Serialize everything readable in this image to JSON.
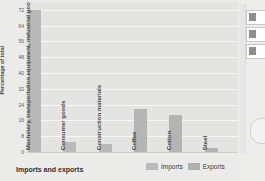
{
  "chart_data": {
    "type": "bar",
    "title": "",
    "xlabel": "Imports and exports",
    "ylabel": "Percentage of total",
    "ylim": [
      0,
      76
    ],
    "grid": true,
    "legend_position": "bottom-right",
    "categories": [
      "Machinery, transportation equipment, industrial goods",
      "Consumer goods",
      "Construction materials",
      "Coffee",
      "Cotton",
      "Steel"
    ],
    "series": [
      {
        "name": "Imports",
        "color": "#bcbcbc",
        "values": [
          72,
          5,
          4,
          null,
          null,
          null
        ]
      },
      {
        "name": "Exports",
        "color": "#b0b0b0",
        "values": [
          null,
          null,
          null,
          22,
          19,
          2
        ]
      }
    ],
    "bars": [
      {
        "label": "Machinery, transportation equipment, industrial goods",
        "value": 72,
        "series": "Imports"
      },
      {
        "label": "Consumer goods",
        "value": 5,
        "series": "Imports"
      },
      {
        "label": "Construction materials",
        "value": 4,
        "series": "Imports"
      },
      {
        "label": "Coffee",
        "value": 22,
        "series": "Exports"
      },
      {
        "label": "Cotton",
        "value": 19,
        "series": "Exports"
      },
      {
        "label": "Steel",
        "value": 2,
        "series": "Exports"
      }
    ],
    "yticks": [
      0,
      8,
      16,
      24,
      32,
      40,
      48,
      56,
      64,
      72
    ],
    "ytick_labels": [
      "0",
      "8",
      "16",
      "24",
      "32",
      "40",
      "48",
      "56",
      "64",
      "72"
    ]
  },
  "legend": {
    "imports_label": "Imports",
    "exports_label": "Exports"
  },
  "axes": {
    "x_title": "Imports and exports",
    "y_title": "Percentage of total"
  },
  "colors": {
    "bar_imports": "#bcbcbc",
    "bar_exports": "#b0b0b0",
    "plot_background": "#e4e4e3",
    "gridline": "#f6f6f6",
    "page_background": "#ebebea"
  }
}
